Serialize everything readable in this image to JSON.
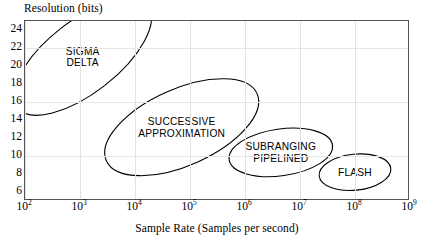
{
  "chart_data": {
    "type": "scatter",
    "title": "",
    "xlabel": "Sample Rate (Samples per second)",
    "ylabel": "Resolution (bits)",
    "xscale": "log",
    "yscale": "linear",
    "xlim": [
      100,
      1000000000
    ],
    "ylim": [
      5,
      25
    ],
    "grid": true,
    "legend": "none",
    "xticks": [
      {
        "exp": "2",
        "base": "10",
        "value": 100
      },
      {
        "exp": "3",
        "base": "10",
        "value": 1000
      },
      {
        "exp": "4",
        "base": "10",
        "value": 10000
      },
      {
        "exp": "5",
        "base": "10",
        "value": 100000
      },
      {
        "exp": "6",
        "base": "10",
        "value": 1000000
      },
      {
        "exp": "7",
        "base": "10",
        "value": 10000000
      },
      {
        "exp": "8",
        "base": "10",
        "value": 100000000
      },
      {
        "exp": "9",
        "base": "10",
        "value": 1000000000
      }
    ],
    "yticks": [
      24,
      22,
      20,
      18,
      16,
      14,
      12,
      10,
      8,
      6
    ],
    "regions": [
      {
        "name": "sigma-delta",
        "label_lines": [
          "SIGMA",
          "DELTA"
        ],
        "x_range": [
          100,
          100000
        ],
        "y_range": [
          17,
          25
        ],
        "center_x_log": 3.05,
        "center_y": 21.0,
        "angle_deg": -38
      },
      {
        "name": "successive-approximation",
        "label_lines": [
          "SUCCESSIVE",
          "APPROXIMATION"
        ],
        "x_range": [
          3200,
          3200000
        ],
        "y_range": [
          9,
          17.5
        ],
        "center_x_log": 4.85,
        "center_y": 13.2,
        "angle_deg": -24
      },
      {
        "name": "subranging-pipelined",
        "label_lines": [
          "SUBRANGING",
          "PIPELINED"
        ],
        "x_range": [
          630000,
          50000000
        ],
        "y_range": [
          7.8,
          13.0
        ],
        "center_x_log": 6.65,
        "center_y": 10.4,
        "angle_deg": -8
      },
      {
        "name": "flash",
        "label_lines": [
          "FLASH"
        ],
        "x_range": [
          31000000,
          630000000
        ],
        "y_range": [
          6.2,
          10.2
        ],
        "center_x_log": 8.0,
        "center_y": 8.2,
        "angle_deg": -6
      }
    ]
  },
  "axes": {
    "y_title": "Resolution (bits)",
    "x_title": "Sample Rate (Samples per second)"
  },
  "colors": {
    "frame": "#555555",
    "grid": "#e4e4e4",
    "ink": "#000000",
    "background": "#ffffff"
  }
}
